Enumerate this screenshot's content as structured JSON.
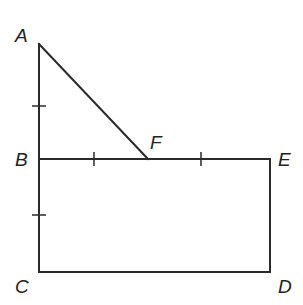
{
  "diagram": {
    "title": "",
    "points": {
      "A": {
        "label": "A",
        "x": 39,
        "y": 44
      },
      "B": {
        "label": "B",
        "x": 39,
        "y": 159
      },
      "C": {
        "label": "C",
        "x": 39,
        "y": 272
      },
      "D": {
        "label": "D",
        "x": 270,
        "y": 272
      },
      "E": {
        "label": "E",
        "x": 270,
        "y": 159
      },
      "F": {
        "label": "F",
        "x": 148,
        "y": 159
      }
    },
    "segments": [
      {
        "from": "A",
        "to": "B"
      },
      {
        "from": "B",
        "to": "C"
      },
      {
        "from": "C",
        "to": "D"
      },
      {
        "from": "D",
        "to": "E"
      },
      {
        "from": "B",
        "to": "F"
      },
      {
        "from": "F",
        "to": "E"
      },
      {
        "from": "A",
        "to": "F"
      }
    ],
    "congruence_ticks": [
      {
        "segment": "AB",
        "count": 1
      },
      {
        "segment": "BC",
        "count": 1
      },
      {
        "segment": "BF",
        "count": 1
      },
      {
        "segment": "FE",
        "count": 1
      }
    ],
    "shapes": [
      {
        "type": "triangle",
        "vertices": [
          "A",
          "B",
          "F"
        ]
      },
      {
        "type": "rectangle",
        "vertices": [
          "B",
          "C",
          "D",
          "E"
        ]
      }
    ],
    "stroke_color": "#2a2a2a",
    "label_color": "#222222"
  }
}
